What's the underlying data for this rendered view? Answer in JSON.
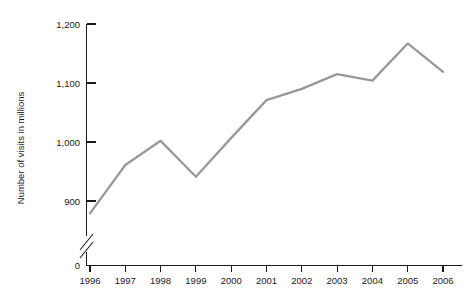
{
  "chart_data": {
    "type": "line",
    "title": "",
    "xlabel": "",
    "ylabel": "Number of visits in millions",
    "categories": [
      "1996",
      "1997",
      "1998",
      "1999",
      "2000",
      "2001",
      "2002",
      "2003",
      "2004",
      "2005",
      "2006"
    ],
    "values": [
      879,
      961,
      1002,
      941,
      1007,
      1071,
      1090,
      1115,
      1104,
      1167,
      1119
    ],
    "series": [
      {
        "name": "Number of visits",
        "values": [
          879,
          961,
          1002,
          941,
          1007,
          1071,
          1090,
          1115,
          1104,
          1167,
          1119
        ]
      }
    ],
    "y_tick_labels": [
      "0",
      "900",
      "1,000",
      "1,100",
      "1,200"
    ],
    "y_tick_values": [
      0,
      900,
      1000,
      1100,
      1200
    ],
    "x_tick_labels": [
      "1996",
      "1997",
      "1998",
      "1999",
      "2000",
      "2001",
      "2002",
      "2003",
      "2004",
      "2005",
      "2006"
    ],
    "ylim": [
      900,
      1200
    ],
    "axis_break": true,
    "grid": false,
    "legend": "none",
    "line_color": "#999999",
    "axis_color": "#1a1a1a",
    "background_color": "#ffffff"
  }
}
